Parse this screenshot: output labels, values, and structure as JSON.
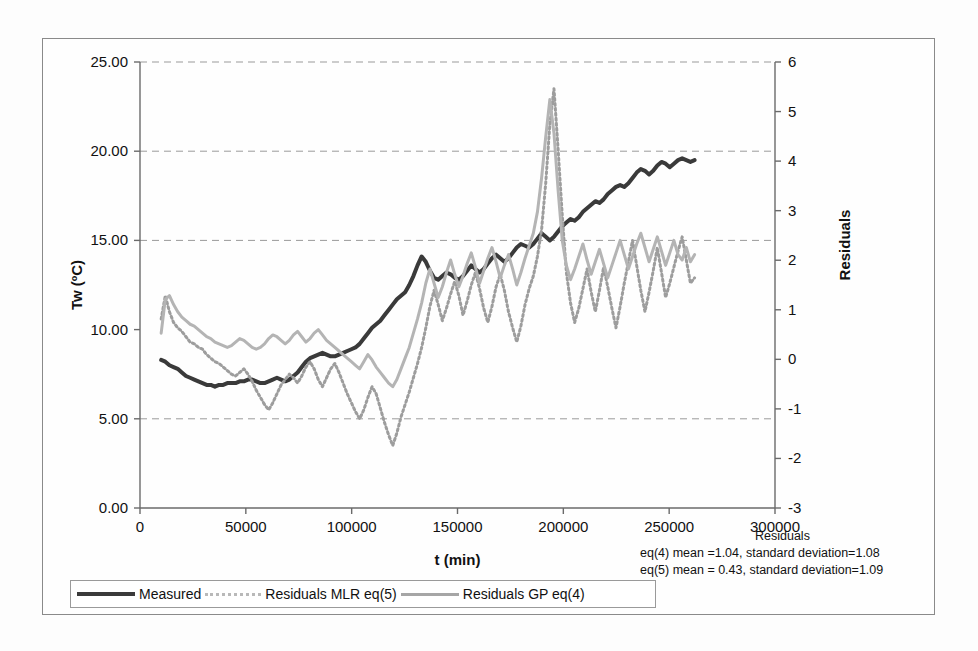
{
  "figure": {
    "background": "#fdfdfd",
    "border_color": "#8a8a8a"
  },
  "axes": {
    "left": {
      "label": "Tw (ºC)",
      "ticks": [
        "0.00",
        "5.00",
        "10.00",
        "15.00",
        "20.00",
        "25.00"
      ],
      "min": 0,
      "max": 25
    },
    "right": {
      "label": "Residuals",
      "ticks": [
        "-3",
        "-2",
        "-1",
        "0",
        "1",
        "2",
        "3",
        "4",
        "5",
        "6"
      ],
      "min": -3,
      "max": 6
    },
    "bottom": {
      "label": "t (min)",
      "ticks": [
        "0",
        "50000",
        "100000",
        "150000",
        "200000",
        "250000",
        "300000"
      ],
      "min": 0,
      "max": 300000
    }
  },
  "legend": {
    "items": [
      {
        "label": "Measured",
        "style": "solid-dark",
        "color": "#3a3a3a"
      },
      {
        "label": "Residuals MLR eq(5)",
        "style": "dotted",
        "color": "#b9b9b9"
      },
      {
        "label": "Residuals GP eq(4)",
        "style": "solid-gray",
        "color": "#a6a6a6"
      }
    ]
  },
  "annotations": {
    "title": "Residuals",
    "line1": "eq(4) mean =1.04, standard deviation=1.08",
    "line2": "eq(5) mean = 0.43, standard deviation=1.09"
  },
  "chart_data": {
    "type": "line",
    "title": "",
    "xlabel": "t (min)",
    "ylabel": "Tw (ºC)",
    "y2label": "Residuals",
    "xlim": [
      0,
      300000
    ],
    "ylim": [
      0,
      25
    ],
    "y2lim": [
      -3,
      6
    ],
    "grid": "horizontal-dashed",
    "gridlines_left": [
      5,
      15,
      20,
      25
    ],
    "legend_position": "below-plot",
    "x_start": 10000,
    "x_end": 262000,
    "n_points": 130,
    "series": [
      {
        "name": "Measured",
        "axis": "left",
        "color": "#3a3a3a",
        "style": "solid",
        "width": 4,
        "values": [
          8.3,
          8.2,
          8.0,
          7.9,
          7.8,
          7.6,
          7.4,
          7.3,
          7.2,
          7.1,
          7.0,
          6.9,
          6.9,
          6.8,
          6.9,
          6.9,
          7.0,
          7.0,
          7.0,
          7.1,
          7.1,
          7.2,
          7.2,
          7.1,
          7.0,
          7.0,
          7.1,
          7.2,
          7.3,
          7.2,
          7.1,
          7.2,
          7.4,
          7.6,
          7.9,
          8.2,
          8.4,
          8.5,
          8.6,
          8.7,
          8.6,
          8.5,
          8.5,
          8.6,
          8.7,
          8.8,
          8.9,
          9.0,
          9.2,
          9.5,
          9.8,
          10.1,
          10.3,
          10.5,
          10.8,
          11.1,
          11.4,
          11.7,
          11.9,
          12.1,
          12.5,
          13.0,
          13.6,
          14.1,
          13.8,
          13.3,
          12.9,
          12.8,
          13.0,
          13.2,
          13.1,
          12.9,
          12.8,
          13.0,
          13.3,
          13.6,
          13.4,
          13.2,
          13.4,
          13.7,
          14.0,
          14.2,
          14.0,
          13.8,
          14.0,
          14.3,
          14.6,
          14.8,
          14.7,
          14.6,
          14.8,
          15.1,
          15.4,
          15.2,
          15.0,
          15.2,
          15.5,
          15.8,
          16.0,
          16.2,
          16.1,
          16.3,
          16.6,
          16.8,
          17.0,
          17.2,
          17.1,
          17.3,
          17.6,
          17.8,
          18.0,
          18.1,
          18.0,
          18.2,
          18.5,
          18.8,
          19.0,
          18.9,
          18.7,
          18.9,
          19.2,
          19.4,
          19.3,
          19.1,
          19.3,
          19.5,
          19.6,
          19.5,
          19.4,
          19.5
        ]
      },
      {
        "name": "Residuals MLR eq(5)",
        "axis": "left-mapped",
        "color": "#9d9d9d",
        "style": "dotted",
        "width": 3,
        "values": [
          10.6,
          11.9,
          11.0,
          10.4,
          10.1,
          9.9,
          9.6,
          9.3,
          9.2,
          9.0,
          8.9,
          8.6,
          8.4,
          8.2,
          8.1,
          7.9,
          7.7,
          7.5,
          7.4,
          7.6,
          7.8,
          7.5,
          7.1,
          6.6,
          6.2,
          5.8,
          5.5,
          5.9,
          6.4,
          6.9,
          7.2,
          7.5,
          7.3,
          7.0,
          7.4,
          7.9,
          8.2,
          7.8,
          7.2,
          6.8,
          7.3,
          7.8,
          8.1,
          7.6,
          7.0,
          6.4,
          5.9,
          5.4,
          5.0,
          5.5,
          6.2,
          6.8,
          6.4,
          5.6,
          4.8,
          4.1,
          3.5,
          4.2,
          5.1,
          5.8,
          6.5,
          7.3,
          8.1,
          9.0,
          10.1,
          11.3,
          12.2,
          11.4,
          10.5,
          11.2,
          12.0,
          12.7,
          11.9,
          10.8,
          11.6,
          12.5,
          13.2,
          12.3,
          11.2,
          10.4,
          11.3,
          12.4,
          13.1,
          12.2,
          11.0,
          10.1,
          9.3,
          10.2,
          11.4,
          12.3,
          13.0,
          14.1,
          15.6,
          18.2,
          21.5,
          23.5,
          20.1,
          16.4,
          13.2,
          11.5,
          10.4,
          11.2,
          12.3,
          13.4,
          12.1,
          11.0,
          12.2,
          13.5,
          12.4,
          11.2,
          10.1,
          11.3,
          12.6,
          13.8,
          15.0,
          13.6,
          12.2,
          11.0,
          12.1,
          13.3,
          14.6,
          13.2,
          11.8,
          12.6,
          13.5,
          14.4,
          15.2,
          13.9,
          12.6,
          12.9
        ]
      },
      {
        "name": "Residuals GP eq(4)",
        "axis": "left-mapped",
        "color": "#b4b4b4",
        "style": "solid",
        "width": 3,
        "values": [
          9.8,
          11.7,
          11.9,
          11.4,
          11.0,
          10.7,
          10.5,
          10.3,
          10.2,
          10.0,
          9.8,
          9.6,
          9.5,
          9.3,
          9.2,
          9.1,
          9.0,
          9.1,
          9.3,
          9.5,
          9.4,
          9.2,
          9.0,
          8.9,
          9.0,
          9.2,
          9.5,
          9.7,
          9.6,
          9.4,
          9.2,
          9.4,
          9.7,
          9.9,
          9.6,
          9.3,
          9.5,
          9.8,
          10.0,
          9.7,
          9.4,
          9.2,
          9.0,
          8.8,
          8.6,
          8.4,
          8.2,
          8.0,
          7.8,
          8.2,
          8.6,
          8.3,
          7.9,
          7.6,
          7.3,
          7.0,
          6.8,
          7.2,
          7.8,
          8.4,
          9.0,
          9.8,
          10.6,
          11.5,
          12.6,
          13.4,
          12.6,
          11.8,
          12.4,
          13.2,
          13.9,
          13.1,
          12.4,
          13.0,
          13.7,
          14.3,
          13.5,
          12.6,
          13.3,
          14.0,
          14.6,
          13.8,
          12.9,
          13.6,
          14.2,
          13.4,
          12.5,
          13.2,
          14.0,
          14.7,
          15.4,
          16.6,
          18.5,
          20.8,
          22.9,
          21.0,
          17.8,
          15.0,
          13.6,
          12.8,
          13.4,
          14.1,
          14.8,
          13.9,
          13.1,
          13.8,
          14.5,
          13.7,
          12.9,
          13.6,
          14.3,
          15.0,
          14.2,
          13.4,
          14.1,
          14.8,
          15.4,
          14.6,
          13.8,
          14.5,
          15.2,
          14.4,
          13.6,
          14.3,
          15.0,
          14.2,
          13.9,
          14.6,
          13.8,
          14.2
        ]
      }
    ]
  }
}
